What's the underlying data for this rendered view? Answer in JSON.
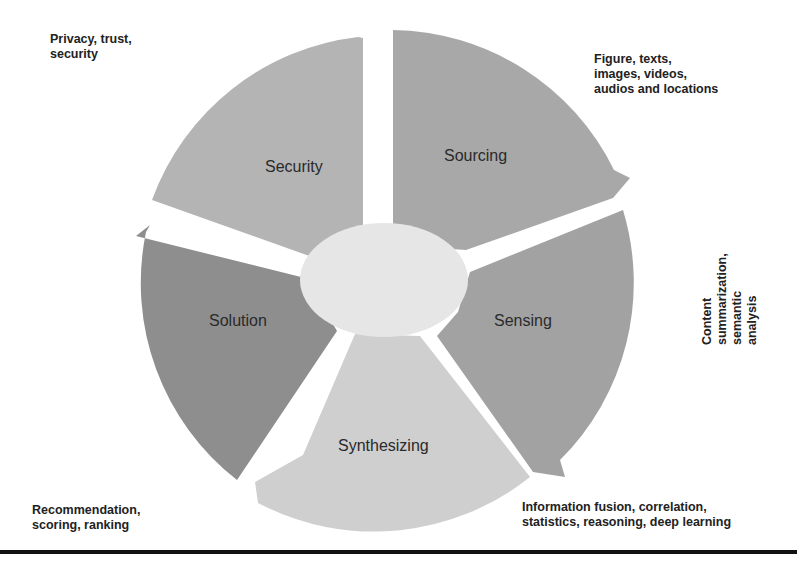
{
  "diagram": {
    "type": "cycle",
    "center": {
      "label": "",
      "color": "#e6e6e6"
    },
    "segments": [
      {
        "id": "sourcing",
        "label": "Sourcing",
        "color": "#a8a8a8",
        "description": "Figure, texts,\nimages, videos,\naudios and locations"
      },
      {
        "id": "sensing",
        "label": "Sensing",
        "color": "#a2a2a2",
        "description": "Content summarization,\nsemantic analysis"
      },
      {
        "id": "synthesizing",
        "label": "Synthesizing",
        "color": "#cfcfcf",
        "description": "Information fusion, correlation,\nstatistics, reasoning, deep learning"
      },
      {
        "id": "solution",
        "label": "Solution",
        "color": "#8e8e8e",
        "description": "Recommendation,\nscoring, ranking"
      },
      {
        "id": "security",
        "label": "Security",
        "color": "#b4b4b4",
        "description": "Privacy, trust,\nsecurity"
      }
    ],
    "rule_color": "#111111"
  }
}
